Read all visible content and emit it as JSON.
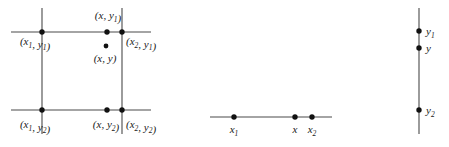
{
  "figure": {
    "background_color": "#ffffff",
    "line_color": "#4a4a4a",
    "dot_color": "#111111",
    "text_color": "#1a1a1a",
    "width": 449,
    "height": 147
  },
  "panels": [
    {
      "id": "grid-panel",
      "name": "two-dimensional-grid-cell",
      "lines": [
        {
          "name": "top-horizontal-line",
          "x1": 11,
          "y1": 32,
          "x2": 151,
          "y2": 32
        },
        {
          "name": "bottom-horizontal-line",
          "x1": 11,
          "y1": 110,
          "x2": 151,
          "y2": 110
        },
        {
          "name": "left-vertical-line",
          "x1": 42,
          "y1": 8,
          "x2": 42,
          "y2": 134
        },
        {
          "name": "right-vertical-line",
          "x1": 122,
          "y1": 8,
          "x2": 122,
          "y2": 134
        }
      ],
      "points": [
        {
          "name": "point-x1-y1",
          "cx": 42,
          "cy": 32,
          "r": 2.7
        },
        {
          "name": "point-x-y1",
          "cx": 107,
          "cy": 32,
          "r": 2.7
        },
        {
          "name": "point-x2-y1",
          "cx": 122,
          "cy": 32,
          "r": 2.7
        },
        {
          "name": "point-x-y",
          "cx": 106,
          "cy": 46,
          "r": 2.4
        },
        {
          "name": "point-x1-y2",
          "cx": 42,
          "cy": 110,
          "r": 2.7
        },
        {
          "name": "point-x-y2",
          "cx": 107,
          "cy": 110,
          "r": 2.7
        },
        {
          "name": "point-x2-y2",
          "cx": 122,
          "cy": 110,
          "r": 2.7
        }
      ],
      "labels": [
        {
          "name": "label-x-y1",
          "x": 108,
          "y": 19,
          "anchor": "middle",
          "parts": [
            {
              "t": "(",
              "sub": false
            },
            {
              "t": "x",
              "sub": false
            },
            {
              "t": ", ",
              "sub": false
            },
            {
              "t": "y",
              "sub": false
            },
            {
              "t": "1",
              "sub": true
            },
            {
              "t": ")",
              "sub": false
            }
          ],
          "text": "(x, y1)"
        },
        {
          "name": "label-x1-y1",
          "x": 35,
          "y": 45,
          "anchor": "middle",
          "parts": [
            {
              "t": "(",
              "sub": false
            },
            {
              "t": "x",
              "sub": false
            },
            {
              "t": "1",
              "sub": true
            },
            {
              "t": ", ",
              "sub": false
            },
            {
              "t": "y",
              "sub": false
            },
            {
              "t": "1",
              "sub": true
            },
            {
              "t": ")",
              "sub": false
            }
          ],
          "text": "(x1, y1)"
        },
        {
          "name": "label-x2-y1",
          "x": 126,
          "y": 45,
          "anchor": "start",
          "parts": [
            {
              "t": "(",
              "sub": false
            },
            {
              "t": "x",
              "sub": false
            },
            {
              "t": "2",
              "sub": true
            },
            {
              "t": ", ",
              "sub": false
            },
            {
              "t": "y",
              "sub": false
            },
            {
              "t": "1",
              "sub": true
            },
            {
              "t": ")",
              "sub": false
            }
          ],
          "text": "(x2, y1)"
        },
        {
          "name": "label-x-y",
          "x": 105,
          "y": 62,
          "anchor": "middle",
          "parts": [
            {
              "t": "(",
              "sub": false
            },
            {
              "t": "x",
              "sub": false
            },
            {
              "t": ", ",
              "sub": false
            },
            {
              "t": "y",
              "sub": false
            },
            {
              "t": ")",
              "sub": false
            }
          ],
          "text": "(x, y)"
        },
        {
          "name": "label-x1-y2",
          "x": 35,
          "y": 128,
          "anchor": "middle",
          "parts": [
            {
              "t": "(",
              "sub": false
            },
            {
              "t": "x",
              "sub": false
            },
            {
              "t": "1",
              "sub": true
            },
            {
              "t": ", ",
              "sub": false
            },
            {
              "t": "y",
              "sub": false
            },
            {
              "t": "2",
              "sub": true
            },
            {
              "t": ")",
              "sub": false
            }
          ],
          "text": "(x1, y2)"
        },
        {
          "name": "label-x-y2",
          "x": 106,
          "y": 128,
          "anchor": "middle",
          "parts": [
            {
              "t": "(",
              "sub": false
            },
            {
              "t": "x",
              "sub": false
            },
            {
              "t": ", ",
              "sub": false
            },
            {
              "t": "y",
              "sub": false
            },
            {
              "t": "2",
              "sub": true
            },
            {
              "t": ")",
              "sub": false
            }
          ],
          "text": "(x, y2)"
        },
        {
          "name": "label-x2-y2",
          "x": 126,
          "y": 128,
          "anchor": "start",
          "parts": [
            {
              "t": "(",
              "sub": false
            },
            {
              "t": "x",
              "sub": false
            },
            {
              "t": "2",
              "sub": true
            },
            {
              "t": ", ",
              "sub": false
            },
            {
              "t": "y",
              "sub": false
            },
            {
              "t": "2",
              "sub": true
            },
            {
              "t": ")",
              "sub": false
            }
          ],
          "text": "(x2, y2)"
        }
      ]
    },
    {
      "id": "x-axis-panel",
      "name": "horizontal-x-axis-line",
      "lines": [
        {
          "name": "x-axis-line",
          "x1": 210,
          "y1": 117,
          "x2": 332,
          "y2": 117
        }
      ],
      "points": [
        {
          "name": "point-x1",
          "cx": 234,
          "cy": 117,
          "r": 2.7
        },
        {
          "name": "point-x",
          "cx": 295,
          "cy": 117,
          "r": 2.7
        },
        {
          "name": "point-x2",
          "cx": 312,
          "cy": 117,
          "r": 2.7
        }
      ],
      "labels": [
        {
          "name": "label-x1",
          "x": 234,
          "y": 133,
          "anchor": "middle",
          "parts": [
            {
              "t": "x",
              "sub": false
            },
            {
              "t": "1",
              "sub": true
            }
          ],
          "text": "x1"
        },
        {
          "name": "label-x",
          "x": 295,
          "y": 133,
          "anchor": "middle",
          "parts": [
            {
              "t": "x",
              "sub": false
            }
          ],
          "text": "x"
        },
        {
          "name": "label-x2",
          "x": 312,
          "y": 133,
          "anchor": "middle",
          "parts": [
            {
              "t": "x",
              "sub": false
            },
            {
              "t": "2",
              "sub": true
            }
          ],
          "text": "x2"
        }
      ]
    },
    {
      "id": "y-axis-panel",
      "name": "vertical-y-axis-line",
      "lines": [
        {
          "name": "y-axis-line",
          "x1": 419,
          "y1": 8,
          "x2": 419,
          "y2": 134
        }
      ],
      "points": [
        {
          "name": "point-y1",
          "cx": 419,
          "cy": 31,
          "r": 2.7
        },
        {
          "name": "point-y",
          "cx": 419,
          "cy": 48,
          "r": 2.7
        },
        {
          "name": "point-y2",
          "cx": 419,
          "cy": 110,
          "r": 2.7
        }
      ],
      "labels": [
        {
          "name": "label-y1",
          "x": 426,
          "y": 35,
          "anchor": "start",
          "parts": [
            {
              "t": "y",
              "sub": false
            },
            {
              "t": "1",
              "sub": true
            }
          ],
          "text": "y1"
        },
        {
          "name": "label-y",
          "x": 426,
          "y": 52,
          "anchor": "start",
          "parts": [
            {
              "t": "y",
              "sub": false
            }
          ],
          "text": "y"
        },
        {
          "name": "label-y2",
          "x": 426,
          "y": 114,
          "anchor": "start",
          "parts": [
            {
              "t": "y",
              "sub": false
            },
            {
              "t": "2",
              "sub": true
            }
          ],
          "text": "y2"
        }
      ]
    }
  ]
}
